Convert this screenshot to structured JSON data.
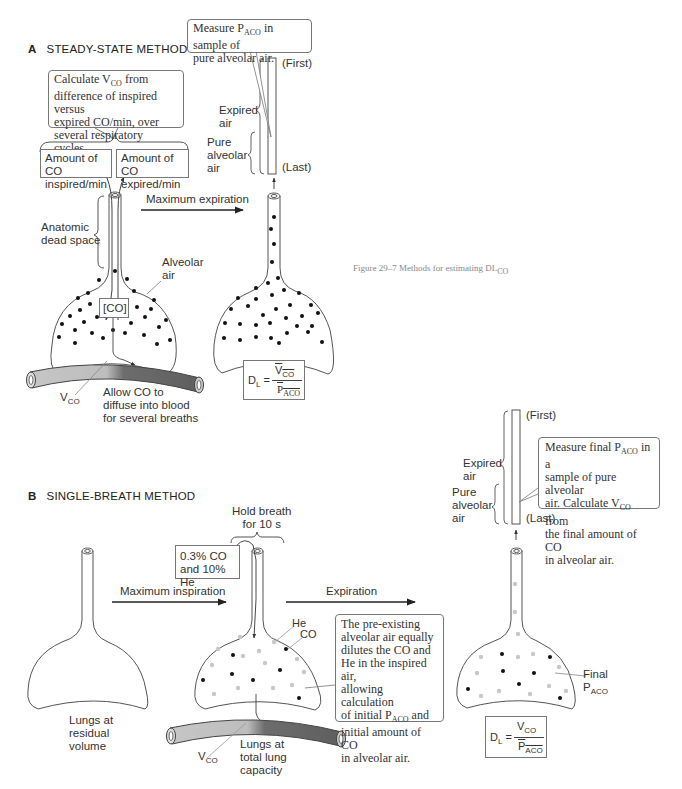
{
  "figure": {
    "caption": "Figure 29–7  Methods for estimating DL",
    "caption_sub": "CO"
  },
  "panel_a": {
    "letter": "A",
    "title": "STEADY-STATE METHOD",
    "callout_measure": {
      "line1_pre": "Measure P",
      "sub": "ACO",
      "line1_post": " in sample of",
      "line2": "pure alveolar air."
    },
    "callout_calculate": {
      "line1_pre": "Calculate V",
      "sub": "CO",
      "line1_post": " from",
      "line2": "difference of inspired versus",
      "line3": "expired CO/min, over",
      "line4": "several respiratory cycles."
    },
    "box_inspired": {
      "line1": "Amount of CO",
      "line2": "inspired/min"
    },
    "box_expired": {
      "line1": "Amount of CO",
      "line2": "expired/min"
    },
    "arrow_label": "Maximum expiration",
    "tube_labels": {
      "first": "(First)",
      "last": "(Last)",
      "expired_air_1": "Expired",
      "expired_air_2": "air",
      "pure_1": "Pure",
      "pure_2": "alveolar",
      "pure_3": "air"
    },
    "anatomic_dead_space": {
      "line1": "Anatomic",
      "line2": "dead space"
    },
    "alveolar_air": {
      "line1": "Alveolar",
      "line2": "air"
    },
    "co_box": "[CO]",
    "vco_label": "V",
    "vco_sub": "CO",
    "allow_co": {
      "line1": "Allow CO to",
      "line2": "diffuse into blood",
      "line3": "for several breaths"
    },
    "formula": {
      "lhs": "D",
      "lhs_sub": "L",
      "eq": "=",
      "num": "V",
      "num_sub": "CO",
      "den": "P",
      "den_sub": "ACO"
    }
  },
  "panel_b": {
    "letter": "B",
    "title": "SINGLE-BREATH METHOD",
    "hold_breath": {
      "line1": "Hold breath",
      "line2": "for 10 s"
    },
    "gas_box": {
      "line1": "0.3% CO",
      "line2": "and 10% He"
    },
    "arrow_inspiration": "Maximum inspiration",
    "arrow_expiration": "Expiration",
    "residual": {
      "line1": "Lungs at",
      "line2": "residual",
      "line3": "volume"
    },
    "total": {
      "line1": "Lungs at",
      "line2": "total lung",
      "line3": "capacity"
    },
    "he_label": "He",
    "co_label": "CO",
    "vco_label": "V",
    "vco_sub": "CO",
    "callout_preexisting": {
      "line1": "The pre-existing",
      "line2": "alveolar air equally",
      "line3": "dilutes the CO and",
      "line4": "He in the inspired air,",
      "line5": "allowing calculation",
      "line6_pre": "of initial P",
      "line6_sub": "ACO",
      "line6_post": "  and",
      "line7": "initial amount of CO",
      "line8": "in alveolar air."
    },
    "callout_final": {
      "line1_pre": "Measure final P",
      "line1_sub": "ACO",
      "line1_post": " in a",
      "line2": "sample of pure alveolar",
      "line3_pre": "air.  Calculate V",
      "line3_sub": "CO",
      "line3_post": " from",
      "line4": "the final amount of CO",
      "line5": "in alveolar air."
    },
    "tube_labels": {
      "first": "(First)",
      "last": "(Last)",
      "expired_air_1": "Expired",
      "expired_air_2": "air",
      "pure_1": "Pure",
      "pure_2": "alveolar",
      "pure_3": "air"
    },
    "final_label": {
      "line1": "Final",
      "line2": "P",
      "sub": "ACO"
    },
    "formula": {
      "lhs": "D",
      "lhs_sub": "L",
      "eq": "=",
      "num": "V",
      "num_sub": "CO",
      "den": "P",
      "den_sub": "ACO"
    }
  },
  "colors": {
    "outline": "#555555",
    "dot_co": "#111111",
    "dot_he": "#c8c8c8",
    "vessel_light": "#bdbdbd",
    "vessel_dark": "#666666",
    "caption": "#888888"
  }
}
